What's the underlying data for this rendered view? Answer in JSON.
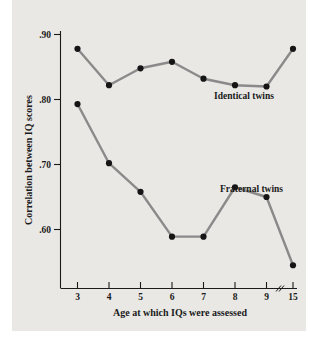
{
  "chart_data": {
    "type": "line",
    "title": "",
    "xlabel": "Age at which IQs were assessed",
    "ylabel": "Correlation between IQ scores",
    "x": [
      3,
      4,
      5,
      6,
      7,
      8,
      9,
      15
    ],
    "xtick_labels": [
      "3",
      "4",
      "5",
      "6",
      "7",
      "8",
      "9",
      "15"
    ],
    "ytick_labels": [
      ".90",
      ".80",
      ".70",
      ".60"
    ],
    "ytick_values": [
      0.9,
      0.8,
      0.7,
      0.6
    ],
    "ylim": [
      0.53,
      0.915
    ],
    "xlim_note": "axis break between 9 and 15",
    "axis_break": true,
    "grid": false,
    "legend_position": "inline-annotation",
    "series": [
      {
        "name": "Identical twins",
        "label": "Identical twins",
        "color": "#8a8a8a",
        "marker_color": "#151515",
        "values": [
          0.878,
          0.822,
          0.848,
          0.858,
          0.832,
          0.822,
          0.82,
          0.878
        ]
      },
      {
        "name": "Fraternal twins",
        "label": "Fraternal twins",
        "color": "#8a8a8a",
        "marker_color": "#151515",
        "values": [
          0.793,
          0.702,
          0.658,
          0.589,
          0.589,
          0.665,
          0.65,
          0.545
        ]
      }
    ]
  },
  "figure": {
    "panel_color": "#e9e8e5",
    "page_color": "#ffffff",
    "axis_color": "#1a1a1a"
  }
}
